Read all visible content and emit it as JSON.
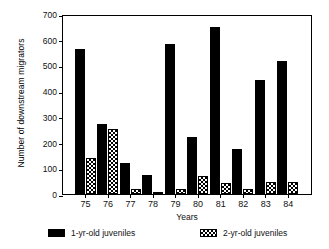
{
  "chart_data": {
    "type": "bar",
    "title": "",
    "xlabel": "Years",
    "ylabel": "Number of downstream migrators",
    "categories": [
      "75",
      "76",
      "77",
      "78",
      "79",
      "80",
      "81",
      "82",
      "83",
      "84"
    ],
    "series": [
      {
        "name": "1-yr-old juveniles",
        "fill": "solid-black",
        "values": [
          563,
          274,
          121,
          74,
          583,
          223,
          649,
          176,
          442,
          516
        ]
      },
      {
        "name": "2-yr-old juveniles",
        "fill": "checkered",
        "values": [
          141,
          254,
          20,
          8,
          20,
          70,
          44,
          20,
          45,
          48
        ]
      }
    ],
    "ylim": [
      0,
      700
    ],
    "yticks": [
      0,
      100,
      200,
      300,
      400,
      500,
      600,
      700
    ],
    "ytick_labels": [
      "0",
      "100",
      "200",
      "300",
      "400",
      "500",
      "600",
      "700"
    ],
    "grid": false,
    "legend_position": "bottom",
    "legend": [
      {
        "label": "1-yr-old juveniles",
        "fill": "solid-black"
      },
      {
        "label": "2-yr-old juveniles",
        "fill": "checkered"
      }
    ],
    "colors": {
      "series1": "#000000",
      "series2_outline": "#000000",
      "series2_fill": "#ffffff",
      "axis": "#000000",
      "background": "#ffffff"
    }
  }
}
